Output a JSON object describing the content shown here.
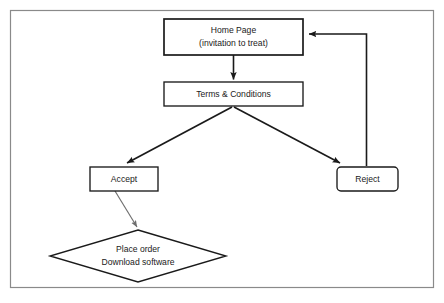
{
  "diagram": {
    "background_color": "#ffffff",
    "line_color": "#1a1a1a",
    "frame": {
      "name": "outer-frame",
      "x": 10,
      "y": 10,
      "width": 424,
      "height": 278,
      "stroke": "#808080"
    },
    "nodes": [
      {
        "id": "home-page",
        "shape": "rectangle",
        "line1": "Home Page",
        "line2": "(invitation to treat)",
        "x": 164,
        "y": 19,
        "width": 139,
        "height": 36,
        "stroke": "#1a1a1a",
        "stroke_width": 1.6
      },
      {
        "id": "terms-conditions",
        "shape": "rectangle",
        "line1": "Terms & Conditions",
        "line2": "",
        "x": 164,
        "y": 82,
        "width": 139,
        "height": 24,
        "stroke": "#1a1a1a",
        "stroke_width": 1.3
      },
      {
        "id": "accept",
        "shape": "rectangle",
        "line1": "Accept",
        "line2": "",
        "x": 90,
        "y": 167,
        "width": 68,
        "height": 24,
        "stroke": "#1a1a1a",
        "stroke_width": 1.3
      },
      {
        "id": "reject",
        "shape": "rounded-rectangle",
        "line1": "Reject",
        "line2": "",
        "x": 337,
        "y": 167,
        "width": 61,
        "height": 24,
        "stroke": "#1a1a1a",
        "stroke_width": 1.3
      },
      {
        "id": "place-order",
        "shape": "diamond",
        "line1": "Place order",
        "line2": "Download software",
        "cx": 138,
        "cy": 256,
        "rx": 88,
        "ry": 26,
        "stroke": "#1a1a1a",
        "stroke_width": 1.3
      }
    ],
    "connectors": [
      {
        "id": "home-to-terms",
        "from": "home-page",
        "to": "terms-conditions",
        "style": "straight-vertical",
        "stroke": "#1a1a1a",
        "stroke_width": 1.5
      },
      {
        "id": "terms-to-accept",
        "from": "terms-conditions",
        "to": "accept",
        "style": "diagonal",
        "stroke": "#1a1a1a",
        "stroke_width": 1.5
      },
      {
        "id": "terms-to-reject",
        "from": "terms-conditions",
        "to": "reject",
        "style": "diagonal",
        "stroke": "#1a1a1a",
        "stroke_width": 1.5
      },
      {
        "id": "accept-to-place-order",
        "from": "accept",
        "to": "place-order",
        "style": "diagonal-thin",
        "stroke": "#6e6e6e",
        "stroke_width": 1.1
      },
      {
        "id": "reject-to-home",
        "from": "reject",
        "to": "home-page",
        "style": "elbow-return",
        "stroke": "#1a1a1a",
        "stroke_width": 1.5
      }
    ]
  }
}
